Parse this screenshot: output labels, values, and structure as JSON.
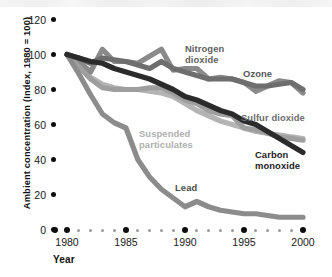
{
  "axes": {
    "y_title": "Ambient concentration (Index, 1980 = 100)",
    "x_title": "Year",
    "y_ticks": [
      "120",
      "100",
      "80",
      "60",
      "40",
      "20",
      "0"
    ],
    "x_ticks": [
      "1980",
      "1985",
      "1990",
      "1995",
      "2000"
    ]
  },
  "labels": {
    "nitrogen_dioxide": "Nitrogen\ndioxide",
    "ozone": "Ozone",
    "sulfur_dioxide": "Sulfur dioxide",
    "carbon_monoxide": "Carbon\nmonoxide",
    "suspended_particulates": "Suspended\nparticulates",
    "lead": "Lead"
  },
  "chart_data": {
    "type": "line",
    "title": "",
    "xlabel": "Year",
    "ylabel": "Ambient concentration (Index, 1980 = 100)",
    "xlim": [
      1980,
      2000
    ],
    "ylim": [
      0,
      120
    ],
    "yticks": [
      0,
      20,
      40,
      60,
      80,
      100,
      120
    ],
    "xticks": [
      1980,
      1985,
      1990,
      1995,
      2000
    ],
    "grid": false,
    "legend": "inline-annotations",
    "x": [
      1980,
      1981,
      1982,
      1983,
      1984,
      1985,
      1986,
      1987,
      1988,
      1989,
      1990,
      1991,
      1992,
      1993,
      1994,
      1995,
      1996,
      1997,
      1998,
      1999,
      2000
    ],
    "series": [
      {
        "name": "Nitrogen dioxide",
        "color": "#6e6e6e",
        "values": [
          100,
          98,
          95,
          98,
          97,
          96,
          94,
          92,
          96,
          92,
          90,
          88,
          86,
          86,
          86,
          84,
          82,
          82,
          83,
          84,
          80
        ]
      },
      {
        "name": "Ozone",
        "color": "#8a8a8a",
        "values": [
          100,
          96,
          90,
          103,
          96,
          96,
          95,
          99,
          103,
          91,
          92,
          92,
          86,
          87,
          86,
          84,
          79,
          82,
          85,
          84,
          78
        ]
      },
      {
        "name": "Sulfur dioxide",
        "color": "#9e9e9e",
        "values": [
          100,
          93,
          86,
          81,
          80,
          80,
          80,
          81,
          81,
          78,
          74,
          72,
          68,
          66,
          65,
          58,
          57,
          55,
          53,
          52,
          51
        ]
      },
      {
        "name": "Carbon monoxide",
        "color": "#2b2b2b",
        "values": [
          100,
          98,
          96,
          95,
          92,
          90,
          88,
          86,
          83,
          80,
          76,
          74,
          71,
          68,
          66,
          62,
          60,
          56,
          52,
          48,
          44
        ]
      },
      {
        "name": "Suspended particulates",
        "color": "#b4b4b4",
        "values": [
          100,
          93,
          87,
          83,
          81,
          80,
          80,
          79,
          78,
          76,
          72,
          68,
          65,
          62,
          60,
          58,
          56,
          55,
          54,
          53,
          52
        ]
      },
      {
        "name": "Lead",
        "color": "#8c8c8c",
        "values": [
          100,
          89,
          77,
          66,
          61,
          58,
          40,
          30,
          23,
          18,
          13,
          16,
          13,
          11,
          10,
          9,
          9,
          8,
          7,
          7,
          7
        ]
      }
    ]
  }
}
